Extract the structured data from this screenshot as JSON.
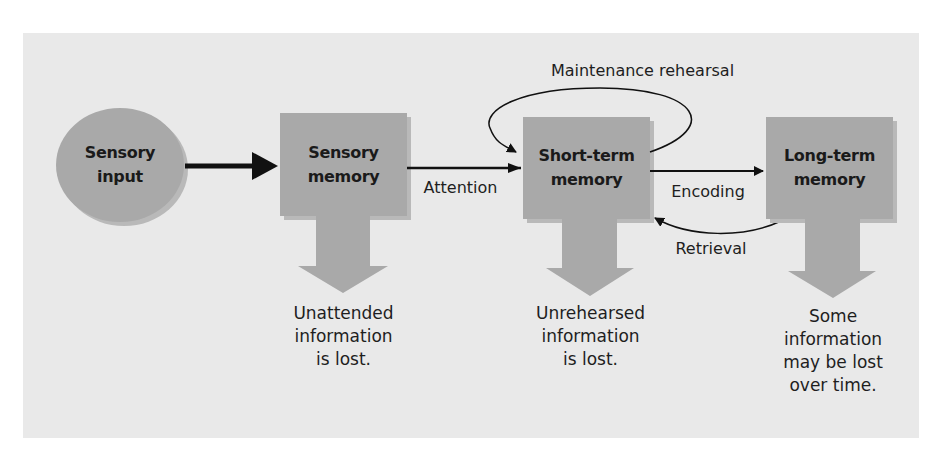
{
  "diagram": {
    "colors": {
      "background": "#e9e9e9",
      "node_fill": "#a9a9a9",
      "node_shadow": "#b9b9b9",
      "arrow": "#111111"
    },
    "nodes": [
      {
        "id": "sensory-input",
        "shape": "ellipse",
        "line1": "Sensory",
        "line2": "input"
      },
      {
        "id": "sensory-memory",
        "shape": "box",
        "line1": "Sensory",
        "line2": "memory",
        "loss_note": [
          "Unattended",
          "information",
          "is lost."
        ]
      },
      {
        "id": "short-term-memory",
        "shape": "box",
        "line1": "Short-term",
        "line2": "memory",
        "loss_note": [
          "Unrehearsed",
          "information",
          "is lost."
        ]
      },
      {
        "id": "long-term-memory",
        "shape": "box",
        "line1": "Long-term",
        "line2": "memory",
        "loss_note": [
          "Some",
          "information",
          "may be lost",
          "over time."
        ]
      }
    ],
    "edges": [
      {
        "from": "sensory-input",
        "to": "sensory-memory",
        "label": ""
      },
      {
        "from": "sensory-memory",
        "to": "short-term-memory",
        "label": "Attention"
      },
      {
        "from": "short-term-memory",
        "to": "short-term-memory",
        "label": "Maintenance rehearsal"
      },
      {
        "from": "short-term-memory",
        "to": "long-term-memory",
        "label": "Encoding"
      },
      {
        "from": "long-term-memory",
        "to": "short-term-memory",
        "label": "Retrieval"
      }
    ]
  }
}
